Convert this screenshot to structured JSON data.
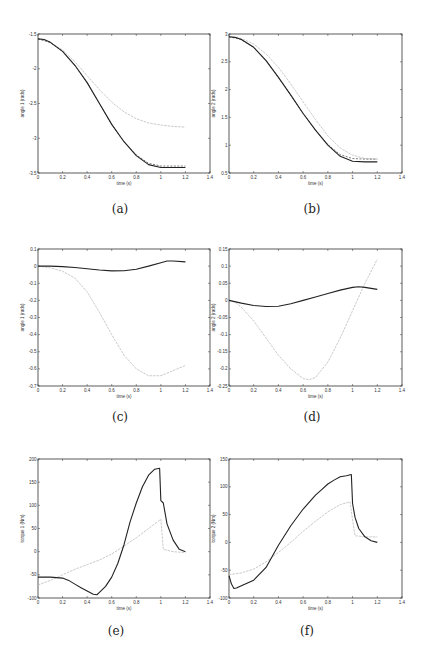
{
  "figure": {
    "panels": [
      {
        "id": "a",
        "caption": "(a)"
      },
      {
        "id": "b",
        "caption": "(b)"
      },
      {
        "id": "c",
        "caption": "(c)"
      },
      {
        "id": "d",
        "caption": "(d)"
      },
      {
        "id": "e",
        "caption": "(e)"
      },
      {
        "id": "f",
        "caption": "(f)"
      }
    ]
  },
  "colors": {
    "actual": "#222222",
    "reference": "#444444",
    "uncontrolled": "#bbbbbb"
  },
  "chart_data": [
    {
      "id": "a",
      "type": "line",
      "xlabel": "time (s)",
      "ylabel": "angle 1 (rads)",
      "xlim": [
        0,
        1.4
      ],
      "ylim": [
        -3.5,
        -1.5
      ],
      "xticks": [
        0,
        0.2,
        0.4,
        0.6,
        0.8,
        1,
        1.2,
        1.4
      ],
      "yticks": [
        -3.5,
        -3,
        -2.5,
        -2,
        -1.5
      ],
      "series": [
        {
          "name": "actual",
          "style": "solid",
          "x": [
            0,
            0.05,
            0.1,
            0.2,
            0.3,
            0.4,
            0.5,
            0.6,
            0.7,
            0.8,
            0.9,
            1.0,
            1.1,
            1.2
          ],
          "y": [
            -1.57,
            -1.58,
            -1.62,
            -1.75,
            -1.95,
            -2.2,
            -2.5,
            -2.8,
            -3.05,
            -3.25,
            -3.38,
            -3.42,
            -3.42,
            -3.42
          ]
        },
        {
          "name": "reference",
          "style": "dashed",
          "x": [
            0,
            0.1,
            0.2,
            0.3,
            0.4,
            0.5,
            0.6,
            0.7,
            0.8,
            0.9,
            1.0,
            1.1,
            1.2
          ],
          "y": [
            -1.57,
            -1.62,
            -1.75,
            -1.95,
            -2.2,
            -2.5,
            -2.8,
            -3.05,
            -3.24,
            -3.36,
            -3.4,
            -3.4,
            -3.4
          ]
        },
        {
          "name": "uncontrolled",
          "style": "dotted",
          "x": [
            0,
            0.1,
            0.2,
            0.3,
            0.4,
            0.5,
            0.6,
            0.7,
            0.8,
            0.9,
            1.0,
            1.1,
            1.2
          ],
          "y": [
            -1.57,
            -1.62,
            -1.73,
            -1.9,
            -2.1,
            -2.3,
            -2.48,
            -2.62,
            -2.72,
            -2.78,
            -2.81,
            -2.83,
            -2.84
          ]
        }
      ]
    },
    {
      "id": "b",
      "type": "line",
      "xlabel": "time (s)",
      "ylabel": "angle 2 (rads)",
      "xlim": [
        0,
        1.4
      ],
      "ylim": [
        0.5,
        3
      ],
      "xticks": [
        0,
        0.2,
        0.4,
        0.6,
        0.8,
        1,
        1.2,
        1.4
      ],
      "yticks": [
        0.5,
        1,
        1.5,
        2,
        2.5,
        3
      ],
      "series": [
        {
          "name": "actual",
          "style": "solid",
          "x": [
            0,
            0.05,
            0.1,
            0.2,
            0.3,
            0.4,
            0.5,
            0.6,
            0.7,
            0.8,
            0.9,
            1.0,
            1.1,
            1.2
          ],
          "y": [
            2.95,
            2.94,
            2.9,
            2.76,
            2.52,
            2.22,
            1.9,
            1.57,
            1.27,
            1.0,
            0.8,
            0.71,
            0.7,
            0.7
          ]
        },
        {
          "name": "reference",
          "style": "dashed",
          "x": [
            0,
            0.1,
            0.2,
            0.3,
            0.4,
            0.5,
            0.6,
            0.7,
            0.8,
            0.9,
            1.0,
            1.1,
            1.2
          ],
          "y": [
            2.95,
            2.9,
            2.76,
            2.52,
            2.22,
            1.9,
            1.57,
            1.27,
            1.01,
            0.83,
            0.76,
            0.75,
            0.75
          ]
        },
        {
          "name": "uncontrolled",
          "style": "dotted",
          "x": [
            0,
            0.1,
            0.2,
            0.3,
            0.4,
            0.5,
            0.6,
            0.7,
            0.8,
            0.9,
            1.0,
            1.1,
            1.2
          ],
          "y": [
            2.95,
            2.92,
            2.82,
            2.64,
            2.4,
            2.1,
            1.78,
            1.46,
            1.17,
            0.95,
            0.82,
            0.76,
            0.75
          ]
        }
      ]
    },
    {
      "id": "c",
      "type": "line",
      "xlabel": "time (s)",
      "ylabel": "angle 1 (rads)",
      "xlim": [
        0,
        1.4
      ],
      "ylim": [
        -0.7,
        0.1
      ],
      "xticks": [
        0,
        0.2,
        0.4,
        0.6,
        0.8,
        1,
        1.2,
        1.4
      ],
      "yticks": [
        -0.7,
        -0.6,
        -0.5,
        -0.4,
        -0.3,
        -0.2,
        -0.1,
        0,
        0.1
      ],
      "series": [
        {
          "name": "actual",
          "style": "solid",
          "x": [
            0,
            0.1,
            0.2,
            0.3,
            0.4,
            0.5,
            0.6,
            0.7,
            0.8,
            0.9,
            1.0,
            1.05,
            1.1,
            1.2
          ],
          "y": [
            0,
            0,
            -0.003,
            -0.008,
            -0.015,
            -0.023,
            -0.028,
            -0.027,
            -0.018,
            0,
            0.02,
            0.03,
            0.03,
            0.025
          ]
        },
        {
          "name": "uncontrolled",
          "style": "dotted",
          "x": [
            0,
            0.1,
            0.2,
            0.3,
            0.4,
            0.5,
            0.6,
            0.7,
            0.8,
            0.9,
            1.0,
            1.1,
            1.2
          ],
          "y": [
            0,
            -0.01,
            -0.03,
            -0.07,
            -0.15,
            -0.27,
            -0.4,
            -0.52,
            -0.6,
            -0.64,
            -0.64,
            -0.61,
            -0.58
          ]
        }
      ]
    },
    {
      "id": "d",
      "type": "line",
      "xlabel": "time (s)",
      "ylabel": "angle 2 (rads)",
      "xlim": [
        0,
        1.4
      ],
      "ylim": [
        -0.25,
        0.15
      ],
      "xticks": [
        0,
        0.2,
        0.4,
        0.6,
        0.8,
        1,
        1.2,
        1.4
      ],
      "yticks": [
        -0.25,
        -0.2,
        -0.15,
        -0.1,
        -0.05,
        0,
        0.05,
        0.1,
        0.15
      ],
      "series": [
        {
          "name": "actual",
          "style": "solid",
          "x": [
            0,
            0.1,
            0.2,
            0.3,
            0.4,
            0.5,
            0.6,
            0.7,
            0.8,
            0.9,
            1.0,
            1.05,
            1.1,
            1.2
          ],
          "y": [
            0,
            -0.008,
            -0.015,
            -0.018,
            -0.017,
            -0.01,
            0,
            0.01,
            0.02,
            0.03,
            0.038,
            0.04,
            0.038,
            0.032
          ]
        },
        {
          "name": "uncontrolled",
          "style": "dotted",
          "x": [
            0,
            0.05,
            0.1,
            0.2,
            0.3,
            0.4,
            0.5,
            0.6,
            0.65,
            0.7,
            0.8,
            0.9,
            1.0,
            1.1,
            1.2
          ],
          "y": [
            0,
            -0.005,
            -0.02,
            -0.06,
            -0.11,
            -0.16,
            -0.2,
            -0.228,
            -0.232,
            -0.225,
            -0.18,
            -0.11,
            -0.03,
            0.05,
            0.12
          ]
        }
      ]
    },
    {
      "id": "e",
      "type": "line",
      "xlabel": "time (s)",
      "ylabel": "torque 1 (Nm)",
      "xlim": [
        0,
        1.4
      ],
      "ylim": [
        -100,
        200
      ],
      "xticks": [
        0,
        0.2,
        0.4,
        0.6,
        0.8,
        1,
        1.2,
        1.4
      ],
      "yticks": [
        -100,
        -50,
        0,
        50,
        100,
        150,
        200
      ],
      "series": [
        {
          "name": "actual",
          "style": "solid",
          "x": [
            0,
            0.1,
            0.2,
            0.25,
            0.3,
            0.35,
            0.4,
            0.45,
            0.48,
            0.5,
            0.55,
            0.6,
            0.65,
            0.7,
            0.75,
            0.8,
            0.85,
            0.9,
            0.95,
            0.99,
            1.0,
            1.02,
            1.05,
            1.1,
            1.15,
            1.2
          ],
          "y": [
            -55,
            -55,
            -57,
            -62,
            -70,
            -78,
            -85,
            -92,
            -93,
            -88,
            -75,
            -55,
            -25,
            15,
            65,
            105,
            140,
            165,
            178,
            180,
            110,
            105,
            60,
            25,
            5,
            0
          ]
        },
        {
          "name": "uncontrolled",
          "style": "dotted",
          "x": [
            0,
            0.1,
            0.2,
            0.3,
            0.4,
            0.5,
            0.6,
            0.7,
            0.8,
            0.9,
            1.0,
            1.02,
            1.1,
            1.2
          ],
          "y": [
            -72,
            -62,
            -50,
            -38,
            -28,
            -18,
            -5,
            12,
            30,
            50,
            70,
            5,
            0,
            -2
          ]
        }
      ]
    },
    {
      "id": "f",
      "type": "line",
      "xlabel": "time (s)",
      "ylabel": "torque 2 (Nm)",
      "xlim": [
        0,
        1.4
      ],
      "ylim": [
        -100,
        150
      ],
      "xticks": [
        0,
        0.2,
        0.4,
        0.6,
        0.8,
        1,
        1.2,
        1.4
      ],
      "yticks": [
        -100,
        -50,
        0,
        50,
        100,
        150
      ],
      "series": [
        {
          "name": "actual",
          "style": "solid",
          "x": [
            0,
            0.02,
            0.04,
            0.06,
            0.1,
            0.2,
            0.3,
            0.4,
            0.5,
            0.6,
            0.7,
            0.75,
            0.8,
            0.85,
            0.9,
            0.95,
            0.99,
            1.0,
            1.02,
            1.05,
            1.1,
            1.15,
            1.2
          ],
          "y": [
            -60,
            -75,
            -83,
            -82,
            -78,
            -68,
            -45,
            -5,
            30,
            60,
            85,
            95,
            105,
            112,
            118,
            120,
            122,
            70,
            45,
            25,
            10,
            3,
            0
          ]
        },
        {
          "name": "uncontrolled",
          "style": "dotted",
          "x": [
            0,
            0.1,
            0.2,
            0.3,
            0.4,
            0.5,
            0.6,
            0.7,
            0.8,
            0.9,
            0.98,
            1.0,
            1.02,
            1.1,
            1.2
          ],
          "y": [
            -58,
            -55,
            -48,
            -35,
            -18,
            0,
            20,
            38,
            55,
            68,
            73,
            40,
            12,
            10,
            10
          ]
        }
      ]
    }
  ]
}
